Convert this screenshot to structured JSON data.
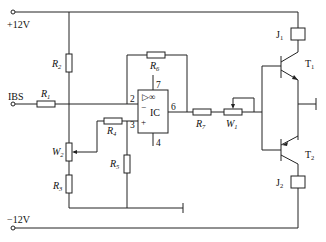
{
  "diagram": {
    "type": "circuit-schematic",
    "supply": {
      "positive": "+12V",
      "negative": "−12V"
    },
    "input": {
      "label": "IBS"
    },
    "components": {
      "R1": {
        "letter": "R",
        "sub": "1"
      },
      "R2": {
        "letter": "R",
        "sub": "2"
      },
      "R3": {
        "letter": "R",
        "sub": "3"
      },
      "R4": {
        "letter": "R",
        "sub": "4"
      },
      "R5": {
        "letter": "R",
        "sub": "5"
      },
      "R6": {
        "letter": "R",
        "sub": "6"
      },
      "R7": {
        "letter": "R",
        "sub": "7"
      },
      "W1": {
        "letter": "W",
        "sub": "1"
      },
      "W2": {
        "letter": "W",
        "sub": "2"
      },
      "J1": {
        "letter": "J",
        "sub": "1"
      },
      "J2": {
        "letter": "J",
        "sub": "2"
      },
      "T1": {
        "letter": "T",
        "sub": "1"
      },
      "T2": {
        "letter": "T",
        "sub": "2"
      }
    },
    "opamp": {
      "label": "IC",
      "symbol": "▷∞",
      "minus": "−",
      "plus": "+",
      "pins": {
        "inv": "2",
        "noninv": "3",
        "out": "6",
        "vpos": "7",
        "vneg": "4"
      }
    }
  }
}
